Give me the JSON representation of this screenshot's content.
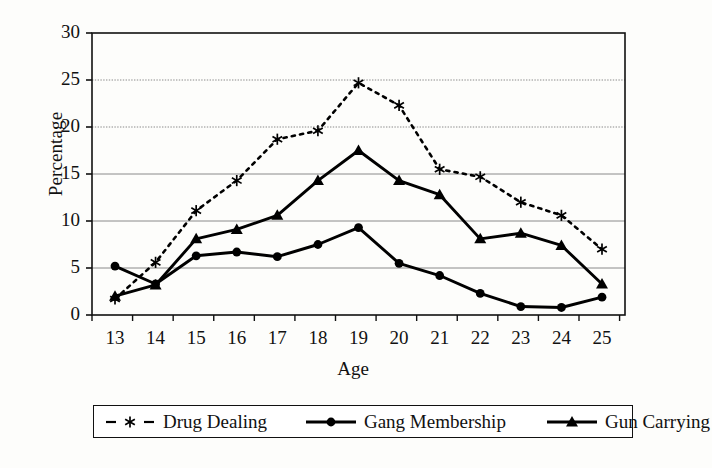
{
  "chart_data": {
    "type": "line",
    "title": "",
    "xlabel": "Age",
    "ylabel": "Percentage",
    "categories": [
      13,
      14,
      15,
      16,
      17,
      18,
      19,
      20,
      21,
      22,
      23,
      24,
      25
    ],
    "x_tick_labels": [
      "13",
      "14",
      "15",
      "16",
      "17",
      "18",
      "19",
      "20",
      "21",
      "22",
      "23",
      "24",
      "25"
    ],
    "y_tick_labels": [
      "0",
      "5",
      "10",
      "15",
      "20",
      "25",
      "30"
    ],
    "y_ticks": [
      0,
      5,
      10,
      15,
      20,
      25,
      30
    ],
    "ylim": [
      0,
      30
    ],
    "xlim": [
      13,
      25
    ],
    "grid": "horizontal",
    "legend_position": "below",
    "series": [
      {
        "name": "Drug Dealing",
        "marker": "asterisk",
        "line_style": "dashed",
        "color": "#000000",
        "values": [
          1.7,
          5.6,
          11.1,
          14.3,
          18.7,
          19.6,
          24.7,
          22.3,
          15.5,
          14.7,
          12.0,
          10.6,
          7.0
        ]
      },
      {
        "name": "Gang Membership",
        "marker": "circle",
        "line_style": "solid",
        "color": "#000000",
        "values": [
          5.2,
          3.3,
          6.3,
          6.7,
          6.2,
          7.5,
          9.3,
          5.5,
          4.2,
          2.3,
          0.9,
          0.8,
          1.9
        ]
      },
      {
        "name": "Gun Carrying",
        "marker": "triangle",
        "line_style": "solid",
        "color": "#000000",
        "values": [
          2.0,
          3.2,
          8.1,
          9.1,
          10.6,
          14.3,
          17.5,
          14.3,
          12.8,
          8.1,
          8.7,
          7.4,
          3.3
        ]
      }
    ]
  },
  "axes": {
    "y_title": "Percentage",
    "x_title": "Age"
  },
  "legend": {
    "items": [
      {
        "label": "Drug Dealing"
      },
      {
        "label": "Gang Membership"
      },
      {
        "label": "Gun Carrying"
      }
    ]
  },
  "style": {
    "axis_color": "#111111",
    "gridline_color": "#8a8a8a",
    "plot_background": "#ffffff",
    "page_background": "#fdfdfb"
  }
}
